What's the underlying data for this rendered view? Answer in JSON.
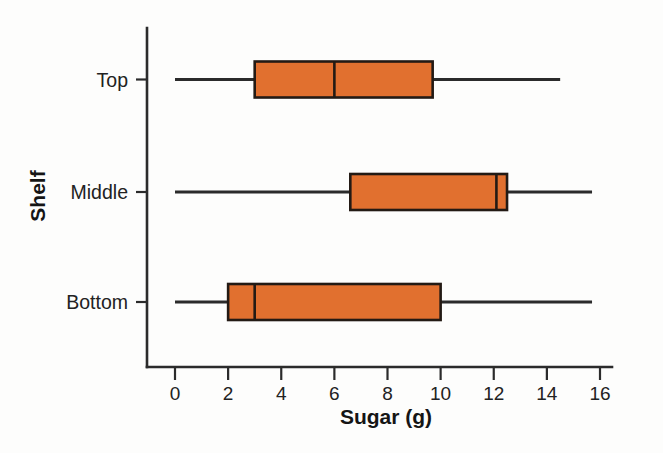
{
  "chart_data": {
    "type": "box",
    "title": "",
    "xlabel": "Sugar (g)",
    "ylabel": "Shelf",
    "orientation": "horizontal",
    "xlim": [
      0,
      16
    ],
    "xticks": [
      0,
      2,
      4,
      6,
      8,
      10,
      12,
      14,
      16
    ],
    "xtick_labels": [
      "0",
      "2",
      "4",
      "6",
      "8",
      "10",
      "12",
      "14",
      "16"
    ],
    "grid": false,
    "legend": "none",
    "categories": [
      "Top",
      "Middle",
      "Bottom"
    ],
    "box_fill_color": "#e1702f",
    "box_edge_color": "#231a14",
    "axis_color": "#2b2b2b",
    "boxes": [
      {
        "category": "Top",
        "min": 0.0,
        "q1": 3.0,
        "median": 6.0,
        "q3": 9.7,
        "max": 14.5
      },
      {
        "category": "Middle",
        "min": 0.0,
        "q1": 6.6,
        "median": 12.1,
        "q3": 12.5,
        "max": 15.7
      },
      {
        "category": "Bottom",
        "min": 0.0,
        "q1": 2.0,
        "median": 3.0,
        "q3": 10.0,
        "max": 15.7
      }
    ]
  },
  "axis": {
    "x_title": "Sugar (g)",
    "y_title": "Shelf"
  },
  "ticks": {
    "x": [
      "0",
      "2",
      "4",
      "6",
      "8",
      "10",
      "12",
      "14",
      "16"
    ],
    "y": [
      "Top",
      "Middle",
      "Bottom"
    ]
  }
}
